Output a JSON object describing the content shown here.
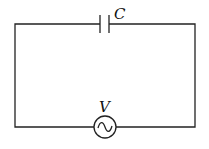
{
  "diagram": {
    "type": "circuit",
    "components": [
      {
        "id": "capacitor",
        "symbol": "capacitor",
        "label": "C",
        "position": "top-wire-center"
      },
      {
        "id": "source",
        "symbol": "ac-voltage-source",
        "label": "V",
        "position": "bottom-wire-center"
      }
    ],
    "labels": {
      "capacitor": "C",
      "source": "V"
    },
    "colors": {
      "stroke": "#222222",
      "background": "#ffffff"
    }
  }
}
